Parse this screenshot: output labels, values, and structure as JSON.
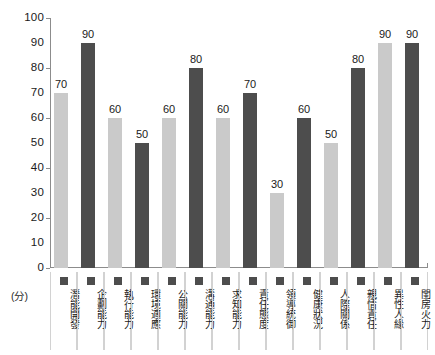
{
  "chart_data": {
    "type": "bar",
    "title": "",
    "subtitle": "",
    "xlabel": "",
    "ylabel": "(分)",
    "ylim": [
      0,
      100
    ],
    "ytick_step": 10,
    "grid": false,
    "legend_position": "below-axis",
    "categories": [
      "潛能開發",
      "企劃能力",
      "執行能力",
      "環境適應",
      "公關能力",
      "溝通能力",
      "求知能力",
      "責任態度",
      "領導統御",
      "健康狀況",
      "人際關係",
      "親情責任",
      "異性人緣",
      "閨房火力"
    ],
    "values": [
      70,
      90,
      60,
      50,
      60,
      80,
      60,
      70,
      30,
      60,
      50,
      80,
      90,
      90
    ],
    "bar_shades": [
      "light",
      "dark",
      "light",
      "dark",
      "light",
      "dark",
      "light",
      "dark",
      "light",
      "dark",
      "light",
      "dark",
      "light",
      "dark"
    ],
    "ytick_labels": [
      "100",
      "90",
      "80",
      "70",
      "60",
      "50",
      "40",
      "30",
      "20",
      "10",
      "0"
    ],
    "ytick_values": [
      100,
      90,
      80,
      70,
      60,
      50,
      40,
      30,
      20,
      10,
      0
    ],
    "colors": {
      "bar_light": "#cacaca",
      "bar_dark": "#4d4d4d",
      "axis": "#8c8c8c",
      "text": "#1a1a1a",
      "legend_divider": "#d2d2d2",
      "background": "#ffffff"
    }
  }
}
